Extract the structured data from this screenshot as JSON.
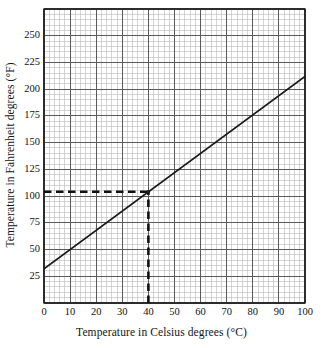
{
  "chart_data": {
    "type": "line",
    "title": "",
    "xlabel": "Temperature in Celsius degrees (°C)",
    "ylabel": "Temperature in Fahrenheit degrees (°F)",
    "xlim": [
      0,
      100
    ],
    "ylim": [
      0,
      275
    ],
    "xticks": [
      0,
      10,
      20,
      30,
      40,
      50,
      60,
      70,
      80,
      90,
      100
    ],
    "xtick_labels": [
      "0",
      "10",
      "20",
      "30",
      "40",
      "50",
      "60",
      "70",
      "80",
      "90",
      "100"
    ],
    "yticks": [
      25,
      50,
      75,
      100,
      125,
      150,
      175,
      200,
      225,
      250
    ],
    "ytick_labels": [
      "25",
      "50",
      "75",
      "100",
      "125",
      "150",
      "175",
      "200",
      "225",
      "250"
    ],
    "grid": true,
    "grid_minor_step_x": 2,
    "grid_minor_step_y": 5,
    "grid_major_step_x": 10,
    "grid_major_step_y": 25,
    "legend": "none",
    "series": [
      {
        "name": "Celsius to Fahrenheit conversion",
        "style": "solid",
        "color": "#1a1a1a",
        "x": [
          0,
          100
        ],
        "values": [
          32,
          212
        ],
        "points": [
          {
            "x": 0,
            "y": 32
          },
          {
            "x": 10,
            "y": 50
          },
          {
            "x": 20,
            "y": 68
          },
          {
            "x": 30,
            "y": 86
          },
          {
            "x": 40,
            "y": 104
          },
          {
            "x": 50,
            "y": 122
          },
          {
            "x": 60,
            "y": 140
          },
          {
            "x": 70,
            "y": 158
          },
          {
            "x": 80,
            "y": 176
          },
          {
            "x": 90,
            "y": 194
          },
          {
            "x": 100,
            "y": 212
          }
        ]
      }
    ],
    "annotations": [
      {
        "name": "guide-horizontal",
        "style": "dashed",
        "color": "#111111",
        "from": {
          "x": 0,
          "y": 104
        },
        "to": {
          "x": 40,
          "y": 104
        },
        "label": "104"
      },
      {
        "name": "guide-vertical",
        "style": "dashed",
        "color": "#111111",
        "from": {
          "x": 40,
          "y": 0
        },
        "to": {
          "x": 40,
          "y": 104
        },
        "label": "40"
      }
    ],
    "marked_point": {
      "x": 40,
      "y": 104
    }
  },
  "axes": {
    "x_title": "Temperature in Celsius degrees (°C)",
    "y_title": "Temperature in Fahrenheit degrees (°F)"
  },
  "colors": {
    "line": "#1a1a1a",
    "guide": "#111111",
    "grid_minor": "#b9b9b9",
    "grid_major": "#5a5a5a",
    "frame": "#151515",
    "background": "#ffffff"
  }
}
